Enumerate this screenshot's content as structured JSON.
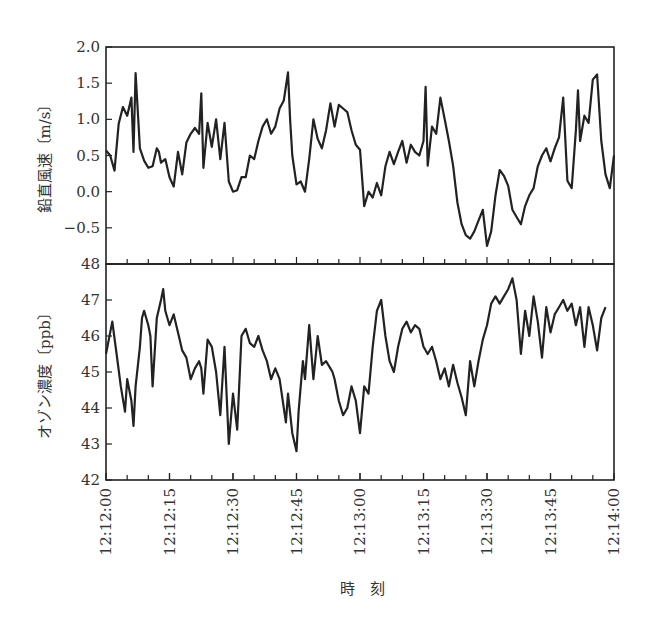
{
  "chart_data": [
    {
      "type": "line",
      "panel": "top",
      "ylabel": "鉛直風速〔m/s〕",
      "ylim": [
        -1.0,
        2.0
      ],
      "yticks": [
        -0.5,
        0.0,
        0.5,
        1.0,
        1.5,
        2.0
      ],
      "ytick_labels": [
        "−0.5",
        "0.0",
        "0.5",
        "1.0",
        "1.5",
        "2.0"
      ],
      "series": [
        {
          "name": "vertical_wind_speed",
          "t_seconds": [
            0,
            1,
            2,
            3,
            4,
            5,
            6,
            6.5,
            7,
            8,
            9,
            10,
            11,
            12,
            12.5,
            13,
            14,
            15,
            16,
            17,
            18,
            19,
            20,
            21,
            22,
            22.5,
            23,
            24,
            25,
            26,
            27,
            28,
            29,
            30,
            31,
            32,
            33,
            34,
            35,
            36,
            37,
            38,
            39,
            40,
            41,
            42,
            43,
            43.5,
            44,
            45,
            46,
            47,
            48,
            49,
            50,
            51,
            52,
            53,
            54,
            55,
            56,
            57,
            58,
            59,
            60,
            61,
            62,
            63,
            64,
            65,
            66,
            67,
            68,
            69,
            70,
            71,
            72,
            73,
            74,
            75,
            75.5,
            76,
            77,
            78,
            79,
            80,
            81,
            82,
            83,
            84,
            85,
            86,
            87,
            88,
            89,
            89.5,
            90,
            91,
            92,
            93,
            94,
            95,
            96,
            97,
            98,
            99,
            100,
            101,
            102,
            103,
            104,
            105,
            106,
            107,
            108,
            109,
            110,
            111,
            111.5,
            112,
            113,
            114,
            115,
            116,
            117,
            118,
            119,
            120
          ],
          "values": [
            0.57,
            0.5,
            0.29,
            0.94,
            1.17,
            1.05,
            1.3,
            0.55,
            1.64,
            0.6,
            0.43,
            0.33,
            0.35,
            0.6,
            0.55,
            0.4,
            0.45,
            0.2,
            0.07,
            0.55,
            0.24,
            0.68,
            0.8,
            0.88,
            0.8,
            1.36,
            0.33,
            0.95,
            0.62,
            1.0,
            0.45,
            0.95,
            0.14,
            0.0,
            0.02,
            0.2,
            0.2,
            0.5,
            0.45,
            0.7,
            0.9,
            1.0,
            0.8,
            0.9,
            1.15,
            1.26,
            1.65,
            1.0,
            0.5,
            0.1,
            0.14,
            0.0,
            0.45,
            1.0,
            0.73,
            0.6,
            0.85,
            1.22,
            0.9,
            1.2,
            1.15,
            1.1,
            0.85,
            0.65,
            0.58,
            -0.2,
            0.0,
            -0.08,
            0.12,
            -0.05,
            0.35,
            0.55,
            0.38,
            0.55,
            0.7,
            0.4,
            0.65,
            0.55,
            0.5,
            0.7,
            1.45,
            0.36,
            0.9,
            0.8,
            1.3,
            1.0,
            0.7,
            0.36,
            -0.15,
            -0.45,
            -0.6,
            -0.65,
            -0.55,
            -0.4,
            -0.25,
            -0.5,
            -0.75,
            -0.55,
            -0.05,
            0.3,
            0.22,
            0.08,
            -0.25,
            -0.35,
            -0.45,
            -0.2,
            -0.05,
            0.05,
            0.35,
            0.5,
            0.6,
            0.42,
            0.6,
            0.75,
            1.3,
            0.15,
            0.05,
            0.85,
            1.4,
            0.7,
            1.05,
            0.95,
            1.55,
            1.62,
            0.7,
            0.24,
            0.05,
            0.5,
            0.95,
            1.1,
            1.25,
            2.0,
            0.95,
            0.15,
            -0.1
          ]
        }
      ]
    },
    {
      "type": "line",
      "panel": "bottom",
      "ylabel": "オゾン濃度〔ppb〕",
      "ylim": [
        42,
        48
      ],
      "yticks": [
        42,
        43,
        44,
        45,
        46,
        47,
        48
      ],
      "ytick_labels": [
        "42",
        "43",
        "44",
        "45",
        "46",
        "47",
        "48"
      ],
      "series": [
        {
          "name": "ozone_concentration",
          "t_seconds": [
            0,
            1,
            1.5,
            2.5,
            3.5,
            4.5,
            5,
            6,
            6.5,
            7,
            8,
            8.5,
            9,
            10,
            10.5,
            11,
            12,
            13,
            13.5,
            14,
            15,
            16,
            17,
            18,
            19,
            20,
            21,
            22,
            22.5,
            23,
            24,
            25,
            26,
            27,
            28,
            29,
            30,
            31,
            32,
            33,
            34,
            35,
            36,
            37,
            38,
            39,
            40,
            41,
            42,
            42.5,
            43,
            44,
            45,
            45.5,
            46,
            46.5,
            47,
            48,
            49,
            50,
            51,
            52,
            53,
            53.5,
            54,
            55,
            56,
            57,
            58,
            59,
            60,
            61,
            62,
            63,
            64,
            65,
            66,
            67,
            68,
            69,
            70,
            71,
            72,
            73,
            74,
            75,
            76,
            77,
            78,
            79,
            80,
            81,
            82,
            83,
            84,
            85,
            86,
            87,
            88,
            89,
            90,
            91,
            92,
            93,
            94,
            95,
            96,
            97,
            98,
            99,
            100,
            101,
            102,
            103,
            104,
            105,
            106,
            107,
            108,
            109,
            110,
            111,
            112,
            113,
            114,
            115,
            116,
            117,
            118,
            119,
            120
          ],
          "values": [
            45.5,
            46.1,
            46.4,
            45.5,
            44.6,
            43.9,
            44.8,
            44.2,
            43.5,
            44.6,
            45.7,
            46.5,
            46.7,
            46.3,
            46.0,
            44.6,
            46.5,
            47.0,
            47.3,
            46.7,
            46.3,
            46.6,
            46.1,
            45.6,
            45.4,
            44.8,
            45.1,
            45.3,
            45.1,
            44.4,
            45.9,
            45.7,
            45.0,
            43.8,
            45.7,
            43.0,
            44.4,
            43.4,
            46.0,
            46.2,
            45.8,
            45.7,
            46.0,
            45.6,
            45.3,
            44.8,
            45.1,
            44.8,
            44.0,
            43.6,
            44.4,
            43.3,
            42.8,
            43.9,
            44.6,
            45.3,
            44.8,
            46.3,
            44.8,
            46.0,
            45.2,
            45.3,
            45.1,
            45.0,
            44.8,
            44.2,
            43.8,
            44.0,
            44.6,
            44.2,
            43.3,
            44.6,
            44.4,
            45.7,
            46.7,
            47.0,
            46.0,
            45.3,
            45.0,
            45.7,
            46.2,
            46.4,
            46.1,
            46.3,
            46.2,
            45.7,
            45.5,
            45.7,
            45.3,
            44.8,
            45.1,
            44.6,
            45.2,
            44.7,
            44.3,
            43.8,
            45.3,
            44.6,
            45.3,
            45.9,
            46.3,
            46.9,
            47.1,
            46.9,
            47.1,
            47.3,
            47.6,
            47.0,
            45.5,
            46.7,
            46.0,
            47.1,
            46.4,
            45.4,
            46.8,
            46.1,
            46.6,
            46.8,
            47.0,
            46.7,
            46.9,
            46.3,
            46.8,
            45.7,
            46.8,
            46.3,
            45.6,
            46.5,
            46.8
          ]
        }
      ]
    }
  ],
  "x_axis": {
    "label": "時　刻",
    "range_seconds": [
      0,
      120
    ],
    "tick_labels": [
      "12:12:00",
      "12:12:15",
      "12:12:30",
      "12:12:45",
      "12:13:00",
      "12:13:15",
      "12:13:30",
      "12:13:45",
      "12:14:00"
    ],
    "major_tick_interval_seconds": 15,
    "minor_tick_interval_seconds": 5
  }
}
